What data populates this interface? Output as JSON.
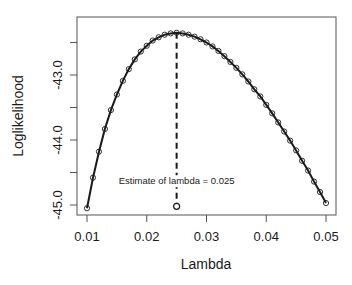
{
  "chart_data": {
    "type": "line",
    "title": "",
    "xlabel": "Lambda",
    "ylabel": "Loglikelihood",
    "xlim": [
      0.0085,
      0.0515
    ],
    "ylim": [
      -45.15,
      -42.1
    ],
    "grid": false,
    "legend": null,
    "x_ticks": [
      0.01,
      0.02,
      0.03,
      0.04,
      0.05
    ],
    "x_tick_labels": [
      "0.01",
      "0.02",
      "0.03",
      "0.04",
      "0.05"
    ],
    "y_ticks": [
      -42.5,
      -43.0,
      -43.5,
      -44.0,
      -44.5,
      -45.0
    ],
    "y_tick_labels": [
      "",
      "-43.0",
      "",
      "-44.0",
      "",
      "-45.0"
    ],
    "series": [
      {
        "name": "loglikelihood",
        "style": "line+open-circles",
        "color": "#1a1a1a",
        "x": [
          0.01,
          0.011,
          0.012,
          0.013,
          0.014,
          0.015,
          0.016,
          0.017,
          0.018,
          0.019,
          0.02,
          0.021,
          0.022,
          0.023,
          0.024,
          0.025,
          0.026,
          0.027,
          0.028,
          0.029,
          0.03,
          0.031,
          0.032,
          0.033,
          0.034,
          0.035,
          0.036,
          0.037,
          0.038,
          0.039,
          0.04,
          0.041,
          0.042,
          0.043,
          0.044,
          0.045,
          0.046,
          0.047,
          0.048,
          0.049,
          0.05
        ],
        "values": [
          -45.05,
          -44.58,
          -44.18,
          -43.83,
          -43.54,
          -43.3,
          -43.09,
          -42.91,
          -42.76,
          -42.64,
          -42.55,
          -42.47,
          -42.42,
          -42.38,
          -42.36,
          -42.35,
          -42.36,
          -42.38,
          -42.41,
          -42.45,
          -42.5,
          -42.56,
          -42.63,
          -42.71,
          -42.8,
          -42.89,
          -42.99,
          -43.1,
          -43.22,
          -43.33,
          -43.46,
          -43.59,
          -43.73,
          -43.87,
          -44.01,
          -44.16,
          -44.32,
          -44.47,
          -44.64,
          -44.8,
          -44.97
        ]
      }
    ],
    "annotations": [
      {
        "type": "vline",
        "x": 0.025,
        "style": "dashed",
        "from_y": -42.35,
        "to_y": -45.02
      },
      {
        "type": "point",
        "x": 0.025,
        "y": -45.02,
        "marker": "open-circle"
      },
      {
        "type": "text",
        "x": 0.025,
        "y": -44.68,
        "text": "Estimate of lambda = 0.025"
      }
    ]
  }
}
